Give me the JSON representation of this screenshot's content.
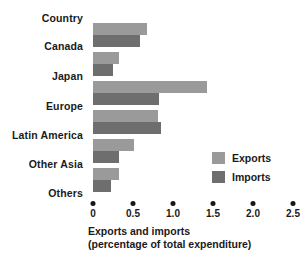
{
  "chart_data": {
    "type": "bar",
    "orientation": "horizontal",
    "title": "",
    "header_label": "Country",
    "categories": [
      "Canada",
      "Japan",
      "Europe",
      "Latin America",
      "Other Asia",
      "Others"
    ],
    "series": [
      {
        "name": "Exports",
        "color": "#9a9a9a",
        "values": [
          0.68,
          0.32,
          1.42,
          0.81,
          0.51,
          0.32
        ]
      },
      {
        "name": "Imports",
        "color": "#6e6e6e",
        "values": [
          0.59,
          0.25,
          0.82,
          0.85,
          0.32,
          0.22
        ]
      }
    ],
    "xlabel_lines": [
      "Exports and imports",
      "(percentage of total expenditure)"
    ],
    "ylabel": "",
    "xlim": [
      0,
      2.5
    ],
    "xticks": [
      0,
      0.5,
      1.0,
      1.5,
      2.0,
      2.5
    ],
    "xtick_labels": [
      "0",
      "0.5",
      "1.0",
      "1.5",
      "2.0",
      "2.5"
    ],
    "grid": false,
    "legend_position": "middle-right",
    "tick_style": "dot"
  }
}
